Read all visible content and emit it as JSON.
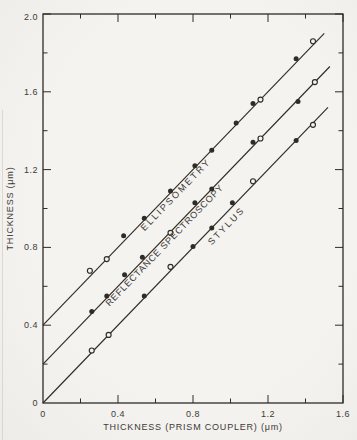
{
  "chart_data": {
    "type": "scatter",
    "title": "",
    "xlabel": "THICKNESS (PRISM COUPLER) (μm)",
    "ylabel": "THICKNESS (μm)",
    "xlim": [
      0,
      1.6
    ],
    "ylim": [
      0,
      2.0
    ],
    "x_major_ticks": [
      0,
      0.4,
      0.8,
      1.2,
      1.6
    ],
    "x_tick_labels": [
      "0",
      "0.4",
      "0.8",
      "1.2",
      "1.6"
    ],
    "y_major_ticks": [
      0,
      0.4,
      0.8,
      1.2,
      1.6,
      2.0
    ],
    "y_tick_labels": [
      "0",
      "0.4",
      "0.8",
      "1.2",
      "1.6",
      "2.0"
    ],
    "minor_tick_step": 0.2,
    "grid": false,
    "ticks_on_all_sides": true,
    "ink_color": "#2e2c28",
    "paper_color": "#f3f2ef",
    "series": [
      {
        "name": "ELLIPSOMETRY",
        "fit_line": {
          "x": [
            0,
            1.5
          ],
          "y": [
            0.4,
            1.9
          ]
        },
        "label_pos": {
          "x": 0.72,
          "y": 1.06
        },
        "label_angle_deg": -46,
        "points": [
          {
            "x": 0.25,
            "y": 0.68,
            "marker": "open"
          },
          {
            "x": 0.34,
            "y": 0.74,
            "marker": "open"
          },
          {
            "x": 0.43,
            "y": 0.86,
            "marker": "filled"
          },
          {
            "x": 0.54,
            "y": 0.95,
            "marker": "filled"
          },
          {
            "x": 0.68,
            "y": 1.09,
            "marker": "filled"
          },
          {
            "x": 0.81,
            "y": 1.22,
            "marker": "filled"
          },
          {
            "x": 0.9,
            "y": 1.3,
            "marker": "filled"
          },
          {
            "x": 1.03,
            "y": 1.44,
            "marker": "filled"
          },
          {
            "x": 1.12,
            "y": 1.54,
            "marker": "filled"
          },
          {
            "x": 1.16,
            "y": 1.56,
            "marker": "open"
          },
          {
            "x": 1.35,
            "y": 1.77,
            "marker": "filled"
          },
          {
            "x": 1.44,
            "y": 1.86,
            "marker": "open"
          }
        ]
      },
      {
        "name": "REFLECTANCE  SPECTROSCOPY",
        "fit_line": {
          "x": [
            0,
            1.53
          ],
          "y": [
            0.2,
            1.73
          ]
        },
        "label_pos": {
          "x": 0.66,
          "y": 0.8
        },
        "label_angle_deg": -46,
        "points": [
          {
            "x": 0.26,
            "y": 0.47,
            "marker": "filled"
          },
          {
            "x": 0.34,
            "y": 0.55,
            "marker": "filled"
          },
          {
            "x": 0.435,
            "y": 0.66,
            "marker": "filled"
          },
          {
            "x": 0.53,
            "y": 0.75,
            "marker": "filled"
          },
          {
            "x": 0.68,
            "y": 0.875,
            "marker": "open"
          },
          {
            "x": 0.81,
            "y": 1.03,
            "marker": "filled"
          },
          {
            "x": 0.9,
            "y": 1.1,
            "marker": "filled"
          },
          {
            "x": 1.12,
            "y": 1.34,
            "marker": "filled"
          },
          {
            "x": 1.16,
            "y": 1.36,
            "marker": "open"
          },
          {
            "x": 1.36,
            "y": 1.55,
            "marker": "filled"
          },
          {
            "x": 1.45,
            "y": 1.65,
            "marker": "open"
          }
        ]
      },
      {
        "name": "STYLUS",
        "fit_line": {
          "x": [
            0,
            1.52
          ],
          "y": [
            0,
            1.52
          ]
        },
        "label_pos": {
          "x": 0.99,
          "y": 0.9
        },
        "label_angle_deg": -46,
        "points": [
          {
            "x": 0.26,
            "y": 0.27,
            "marker": "open"
          },
          {
            "x": 0.35,
            "y": 0.35,
            "marker": "open"
          },
          {
            "x": 0.54,
            "y": 0.55,
            "marker": "filled"
          },
          {
            "x": 0.68,
            "y": 0.7,
            "marker": "open"
          },
          {
            "x": 0.8,
            "y": 0.805,
            "marker": "filled"
          },
          {
            "x": 0.9,
            "y": 0.9,
            "marker": "filled"
          },
          {
            "x": 1.01,
            "y": 1.03,
            "marker": "filled"
          },
          {
            "x": 1.12,
            "y": 1.14,
            "marker": "open"
          },
          {
            "x": 1.35,
            "y": 1.35,
            "marker": "filled"
          },
          {
            "x": 1.44,
            "y": 1.43,
            "marker": "open"
          }
        ]
      }
    ]
  }
}
